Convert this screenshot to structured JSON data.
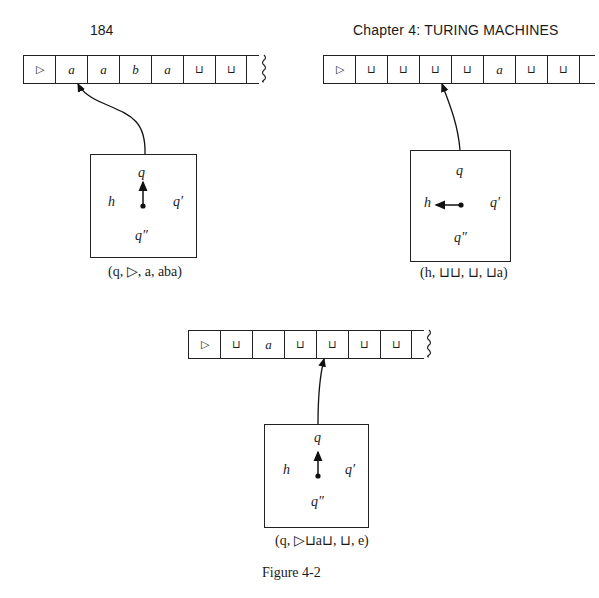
{
  "header": {
    "page_number": "184",
    "chapter_title": "Chapter 4:  TURING MACHINES"
  },
  "configurations": [
    {
      "tape": [
        "▷",
        "a",
        "a",
        "b",
        "a",
        "⊔",
        "⊔"
      ],
      "tape_truncated": true,
      "head_position": 1,
      "states": {
        "top": "q",
        "left": "h",
        "right": "q′",
        "bottom": "q″"
      },
      "arrow_direction": "up",
      "caption": "(q, ▷, a, aba)"
    },
    {
      "tape": [
        "▷",
        "⊔",
        "⊔",
        "⊔",
        "⊔",
        "a",
        "⊔",
        "⊔"
      ],
      "tape_truncated": false,
      "head_position": 3,
      "states": {
        "top": "q",
        "left": "h",
        "right": "q′",
        "bottom": "q″"
      },
      "arrow_direction": "left",
      "caption": "(h, ⊔⊔, ⊔, ⊔a)"
    },
    {
      "tape": [
        "▷",
        "⊔",
        "a",
        "⊔",
        "⊔",
        "⊔",
        "⊔"
      ],
      "tape_truncated": true,
      "head_position": 4,
      "states": {
        "top": "q",
        "left": "h",
        "right": "q′",
        "bottom": "q″"
      },
      "arrow_direction": "up",
      "caption": "(q, ▷⊔a⊔, ⊔, e)"
    }
  ],
  "figure_caption": "Figure 4-2"
}
